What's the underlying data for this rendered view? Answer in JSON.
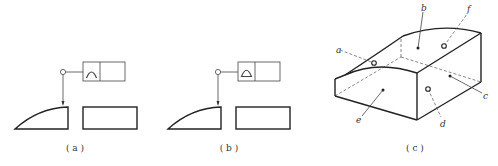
{
  "panels": [
    {
      "id": "a",
      "caption": "( a )",
      "symbol": "line-profile",
      "symbol_icon": "arc-icon"
    },
    {
      "id": "b",
      "caption": "( b )",
      "symbol": "surface-profile",
      "symbol_icon": "half-disc-icon"
    },
    {
      "id": "c",
      "caption": "( c )",
      "labels": {
        "a": "a",
        "b": "b",
        "c": "c",
        "d": "d",
        "e": "e",
        "f": "f"
      }
    }
  ]
}
